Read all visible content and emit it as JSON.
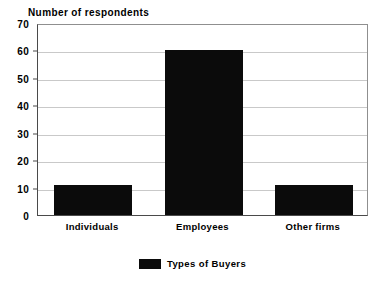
{
  "chart_data": {
    "type": "bar",
    "title": "Number of respondents",
    "xlabel": "",
    "ylabel": "",
    "categories": [
      "Individuals",
      "Employees",
      "Other firms"
    ],
    "values": [
      11,
      60,
      11
    ],
    "series": [
      {
        "name": "Types of Buyers",
        "values": [
          11,
          60,
          11
        ],
        "color": "#0b0b0b"
      }
    ],
    "ylim": [
      0,
      70
    ],
    "yticks": [
      0,
      10,
      20,
      30,
      40,
      50,
      60,
      70
    ],
    "ytick_labels": [
      "0",
      "10",
      "20",
      "30",
      "40",
      "50",
      "60",
      "70"
    ],
    "grid": true,
    "grid_axis": "y",
    "legend": {
      "position": "bottom-center",
      "entries": [
        {
          "label": "Types of Buyers",
          "color": "#0b0b0b"
        }
      ]
    },
    "colors": {
      "bar": "#0b0b0b",
      "gridline": "#c9c9c9",
      "axis": "#4a4a4a",
      "background": "#ffffff",
      "text": "#000000"
    }
  }
}
